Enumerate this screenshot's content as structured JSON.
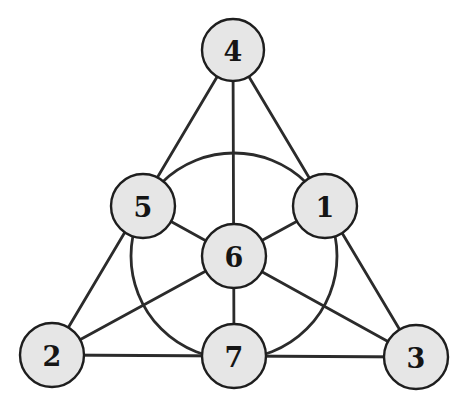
{
  "diagram": {
    "colors": {
      "line": "#2b2b2b",
      "node_fill": "#e6e6e6",
      "node_stroke": "#1e1e1e",
      "label": "#151515"
    },
    "nodes": [
      {
        "id": "1",
        "label": "1",
        "x": 325,
        "y": 206
      },
      {
        "id": "2",
        "label": "2",
        "x": 52,
        "y": 355
      },
      {
        "id": "3",
        "label": "3",
        "x": 416,
        "y": 357
      },
      {
        "id": "4",
        "label": "4",
        "x": 233,
        "y": 50
      },
      {
        "id": "5",
        "label": "5",
        "x": 143,
        "y": 206
      },
      {
        "id": "6",
        "label": "6",
        "x": 234,
        "y": 256
      },
      {
        "id": "7",
        "label": "7",
        "x": 234,
        "y": 356
      }
    ],
    "lines": [
      {
        "through": [
          "4",
          "5",
          "2"
        ]
      },
      {
        "through": [
          "4",
          "1",
          "3"
        ]
      },
      {
        "through": [
          "2",
          "7",
          "3"
        ]
      },
      {
        "through": [
          "4",
          "6",
          "7"
        ]
      },
      {
        "through": [
          "5",
          "6",
          "3"
        ]
      },
      {
        "through": [
          "1",
          "6",
          "2"
        ]
      }
    ],
    "circle": {
      "through": [
        "5",
        "1",
        "7"
      ],
      "cx": 234,
      "cy": 256,
      "r": 103
    }
  }
}
